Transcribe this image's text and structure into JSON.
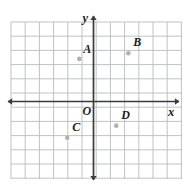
{
  "chart_data": {
    "type": "scatter",
    "title": "",
    "xlabel": "x",
    "ylabel": "y",
    "origin_label": "O",
    "grid": true,
    "grid_spacing_units": 1,
    "xlim": [
      -6,
      6.2
    ],
    "ylim": [
      -5.6,
      5.6
    ],
    "axis_arrows": [
      "left",
      "right",
      "up",
      "down"
    ],
    "points": [
      {
        "label": "A",
        "x": -1,
        "y": 3,
        "label_dx": 4,
        "label_dy": -16
      },
      {
        "label": "B",
        "x": 2.45,
        "y": 3.4,
        "label_dx": 5,
        "label_dy": -17
      },
      {
        "label": "C",
        "x": -1.85,
        "y": -2.55,
        "label_dx": 5,
        "label_dy": -17
      },
      {
        "label": "D",
        "x": 1.6,
        "y": -1.7,
        "label_dx": 5,
        "label_dy": -17
      }
    ],
    "colors": {
      "background": "#ffffff",
      "grid_line": "#b9bbbd",
      "axis_line": "#3b3b3b",
      "point_fill": "#b0b2b4",
      "text": "#231f20"
    }
  },
  "geometry": {
    "origin_px": {
      "x": 93.5,
      "y": 101.5
    },
    "unit_px": 14.2,
    "grid_bounds_px": {
      "left": 11,
      "right": 182,
      "top": 22,
      "bottom": 179
    }
  }
}
